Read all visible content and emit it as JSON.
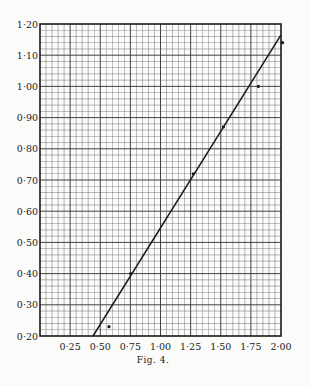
{
  "chart_data": {
    "type": "scatter",
    "title": "",
    "caption": "Fig. 4.",
    "xlabel": "",
    "ylabel": "",
    "xlim": [
      0,
      2.0
    ],
    "ylim": [
      0.2,
      1.2
    ],
    "grid": true,
    "x_ticks": [
      "0·25",
      "0·50",
      "0·75",
      "1·00",
      "1·25",
      "1·50",
      "1·75",
      "2·00"
    ],
    "x_tick_values": [
      0.25,
      0.5,
      0.75,
      1.0,
      1.25,
      1.5,
      1.75,
      2.0
    ],
    "y_ticks": [
      "0·20",
      "0·30",
      "0·40",
      "0·50",
      "0·60",
      "0·70",
      "0·80",
      "0·90",
      "1·00",
      "1·10",
      "1·20"
    ],
    "y_tick_values": [
      0.2,
      0.3,
      0.4,
      0.5,
      0.6,
      0.7,
      0.8,
      0.9,
      1.0,
      1.1,
      1.2
    ],
    "series": [
      {
        "name": "observations",
        "type": "scatter",
        "x": [
          0.56,
          0.74,
          1.26,
          1.51,
          1.8,
          2.0
        ],
        "y": [
          0.23,
          0.4,
          0.72,
          0.87,
          1.0,
          1.14
        ]
      },
      {
        "name": "fitted line",
        "type": "line",
        "x": [
          0.44,
          2.0
        ],
        "y": [
          0.2,
          1.165
        ]
      }
    ]
  },
  "colors": {
    "paper": "#fbfbf9",
    "ink": "#1a1a1a",
    "grid": "#3a3a3a"
  }
}
